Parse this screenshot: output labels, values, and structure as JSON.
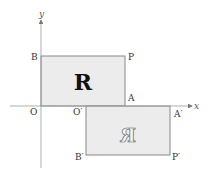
{
  "diagram": {
    "axes": {
      "x_label": "x",
      "y_label": "y"
    },
    "rect_original": {
      "letter": "R",
      "corners": {
        "origin": "O",
        "top_left": "B",
        "top_right": "P",
        "bottom_right": "A"
      }
    },
    "rect_image": {
      "letter": "R",
      "corners": {
        "top_left": "O′",
        "top_right": "A′",
        "bottom_left": "B′",
        "bottom_right": "P′"
      }
    },
    "colors": {
      "fill": "#ececec",
      "stroke": "#888888",
      "axis": "#999999",
      "letter": "#111111"
    }
  }
}
